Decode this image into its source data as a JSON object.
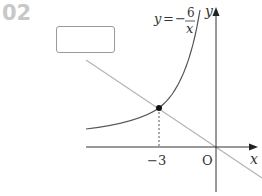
{
  "problem": {
    "number": "02"
  },
  "answer_box": {
    "value": ""
  },
  "graph": {
    "function_label": "y = -6/x",
    "function_label_parts": {
      "lhs": "y",
      "eq": "=",
      "sign": "−",
      "numerator": "6",
      "denominator": "x"
    },
    "x_axis_label": "x",
    "y_axis_label": "y",
    "origin_label": "O",
    "x_tick_label": "−3",
    "point": {
      "x": -3,
      "y": 2
    },
    "line": "passes through O and (−3, 2)",
    "colors": {
      "axis": "#333333",
      "curve": "#555555",
      "line": "#b4b4b4",
      "number": "#c8c8c8"
    }
  }
}
